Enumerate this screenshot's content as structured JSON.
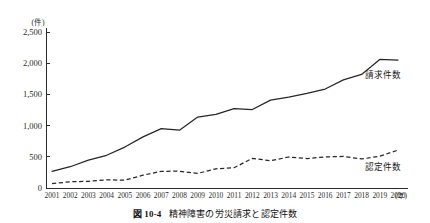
{
  "caption": {
    "number": "図 10-4",
    "title": "精神障害の労災請求と認定件数"
  },
  "axes": {
    "y_unit": "(件)",
    "x_unit": "(年)",
    "y_ticks": [
      "2,500",
      "2,000",
      "1,500",
      "1,000",
      "500",
      "0"
    ],
    "y_tick_values": [
      2500,
      2000,
      1500,
      1000,
      500,
      0
    ]
  },
  "series_labels": {
    "claims": "請求件数",
    "approvals": "認定件数"
  },
  "chart_data": {
    "type": "line",
    "title": "精神障害の労災請求と認定件数",
    "xlabel": "(年)",
    "ylabel": "(件)",
    "ylim": [
      0,
      2500
    ],
    "ytick_step": 500,
    "grid": false,
    "legend": "inline-right",
    "categories": [
      "2001",
      "2002",
      "2003",
      "2004",
      "2005",
      "2006",
      "2007",
      "2008",
      "2009",
      "2010",
      "2011",
      "2012",
      "2013",
      "2014",
      "2015",
      "2016",
      "2017",
      "2018",
      "2019",
      "2020"
    ],
    "series": [
      {
        "name": "請求件数",
        "style": "solid",
        "values": [
          265,
          341,
          447,
          524,
          656,
          819,
          952,
          927,
          1136,
          1181,
          1272,
          1257,
          1409,
          1456,
          1515,
          1586,
          1732,
          1820,
          2060,
          2051
        ]
      },
      {
        "name": "認定件数",
        "style": "dashed",
        "values": [
          70,
          100,
          108,
          130,
          127,
          205,
          268,
          269,
          234,
          308,
          325,
          475,
          436,
          497,
          472,
          498,
          506,
          465,
          509,
          608
        ]
      }
    ]
  }
}
